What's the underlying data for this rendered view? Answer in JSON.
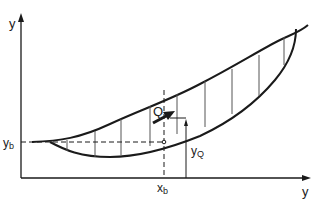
{
  "diagram": {
    "axes": {
      "vertical_label": "y",
      "horizontal_label": "y"
    },
    "labels": {
      "yb_main": "y",
      "yb_sub": "b",
      "xb_main": "x",
      "xb_sub": "b",
      "yq_main": "y",
      "yq_sub": "Q",
      "force": "Q"
    },
    "colors": {
      "stroke": "#1a1a1a",
      "hatch": "#555555",
      "background": "#ffffff"
    }
  }
}
